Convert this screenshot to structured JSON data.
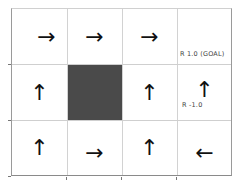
{
  "grid": {
    "rows": 3,
    "cols": 4,
    "cells": [
      {
        "row": 0,
        "col": 0,
        "type": "arrow",
        "direction": "right",
        "glyph": "→"
      },
      {
        "row": 0,
        "col": 1,
        "type": "arrow",
        "direction": "right",
        "glyph": "→"
      },
      {
        "row": 0,
        "col": 2,
        "type": "arrow",
        "direction": "right",
        "glyph": "→"
      },
      {
        "row": 0,
        "col": 3,
        "type": "terminal",
        "label": "R 1.0 (GOAL)"
      },
      {
        "row": 1,
        "col": 0,
        "type": "arrow",
        "direction": "up",
        "glyph": "↑"
      },
      {
        "row": 1,
        "col": 1,
        "type": "wall"
      },
      {
        "row": 1,
        "col": 2,
        "type": "arrow",
        "direction": "up",
        "glyph": "↑"
      },
      {
        "row": 1,
        "col": 3,
        "type": "arrow",
        "direction": "up",
        "glyph": "↑",
        "label": "R -1.0"
      },
      {
        "row": 2,
        "col": 0,
        "type": "arrow",
        "direction": "up",
        "glyph": "↑"
      },
      {
        "row": 2,
        "col": 1,
        "type": "arrow",
        "direction": "right",
        "glyph": "→"
      },
      {
        "row": 2,
        "col": 2,
        "type": "arrow",
        "direction": "up",
        "glyph": "↑"
      },
      {
        "row": 2,
        "col": 3,
        "type": "arrow",
        "direction": "left",
        "glyph": "←"
      }
    ]
  },
  "labels": {
    "goal": "R 1.0 (GOAL)",
    "penalty": "R -1.0"
  },
  "colors": {
    "wall": "#4a4a4a",
    "arrow": "#111111",
    "gridline": "#d0d0d0"
  }
}
